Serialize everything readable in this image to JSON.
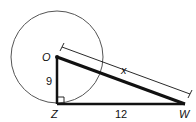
{
  "diagram": {
    "type": "geometry",
    "points": {
      "O": {
        "label": "O"
      },
      "Z": {
        "label": "Z"
      },
      "W": {
        "label": "W"
      }
    },
    "segments": {
      "OZ": {
        "label": "9"
      },
      "ZW": {
        "label": "12"
      },
      "OW": {
        "label": "x"
      }
    },
    "right_angle_at": "Z",
    "colors": {
      "stroke": "#111111",
      "circle": "#555555",
      "background": "#ffffff"
    }
  }
}
